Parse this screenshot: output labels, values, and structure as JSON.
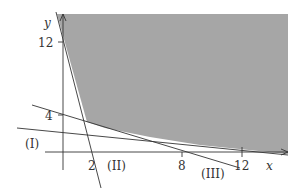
{
  "diagram": {
    "type": "linear-programming-feasible-region",
    "axes": {
      "x_label": "x",
      "y_label": "y",
      "x_ticks": [
        "2",
        "8",
        "12"
      ],
      "y_ticks": [
        "4",
        "12"
      ]
    },
    "lines": [
      {
        "id": "I",
        "label": "(I)"
      },
      {
        "id": "II",
        "label": "(II)"
      },
      {
        "id": "III",
        "label": "(III)"
      }
    ],
    "colors": {
      "shaded_region": "#a6a6a6",
      "line": "#333333",
      "background": "#ffffff"
    }
  }
}
